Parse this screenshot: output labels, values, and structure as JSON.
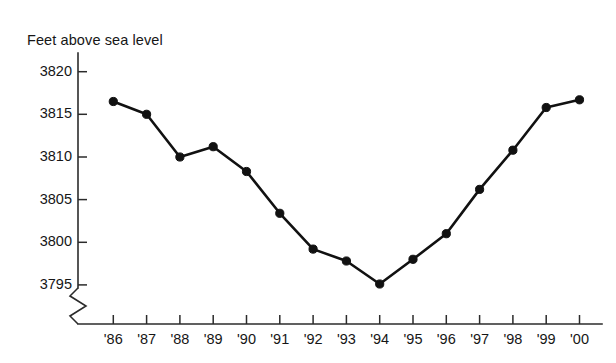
{
  "chart_data": {
    "type": "line",
    "title": "Feet above sea level",
    "xlabel": "",
    "ylabel": "Feet above sea level",
    "categories": [
      "'86",
      "'87",
      "'88",
      "'89",
      "'90",
      "'91",
      "'92",
      "'93",
      "'94",
      "'95",
      "'96",
      "'97",
      "'98",
      "'99",
      "'00"
    ],
    "values": [
      3816.5,
      3815.0,
      3810.0,
      3811.2,
      3808.3,
      3803.4,
      3799.2,
      3797.8,
      3795.1,
      3798.0,
      3801.0,
      3806.2,
      3810.8,
      3815.8,
      3816.7
    ],
    "series": [
      {
        "name": "Feet above sea level",
        "values": [
          3816.5,
          3815.0,
          3810.0,
          3811.2,
          3808.3,
          3803.4,
          3799.2,
          3797.8,
          3795.1,
          3798.0,
          3801.0,
          3806.2,
          3810.8,
          3815.8,
          3816.7
        ]
      }
    ],
    "ylim": [
      3793.5,
      3821.5
    ],
    "yticks": [
      3795,
      3800,
      3805,
      3810,
      3815,
      3820
    ],
    "ytick_labels": [
      "3795",
      "3800",
      "3805",
      "3810",
      "3815",
      "3820"
    ],
    "xtick_labels": [
      "'86",
      "'87",
      "'88",
      "'89",
      "'90",
      "'91",
      "'92",
      "'93",
      "'94",
      "'95",
      "'96",
      "'97",
      "'98",
      "'99",
      "'00"
    ],
    "grid": false,
    "legend": "none",
    "axis_break": "y-axis broken below 3795",
    "marker": "filled-circle",
    "line_color": "#111111",
    "axis_color": "#2b2b2b"
  }
}
